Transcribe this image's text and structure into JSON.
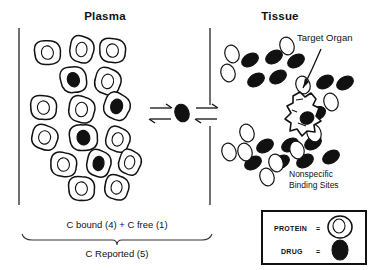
{
  "figure": {
    "type": "diagram",
    "background_color": "#ffffff",
    "ink_color": "#111111"
  },
  "headers": {
    "left": "Plasma",
    "right": "Tissue"
  },
  "annotations": {
    "target_organ": "Target Organ",
    "nonspecific_line1": "Nonspecific",
    "nonspecific_line2": "Binding Sites"
  },
  "bracket": {
    "top_text": "C bound (4) + C free (1)",
    "bottom_text": "C Reported (5)"
  },
  "legend": {
    "rows": [
      {
        "label": "PROTEIN",
        "equals": "=",
        "symbol": "protein-outline"
      },
      {
        "label": "DRUG",
        "equals": "=",
        "symbol": "drug-filled-ellipse"
      }
    ]
  },
  "counts": {
    "plasma_protein_cells": 16,
    "plasma_bound_drug": 4,
    "free_drug_center": 1,
    "c_bound": 4,
    "c_free": 1,
    "c_reported": 5
  },
  "plasma_cells": [
    {
      "cx": 48,
      "cy": 53,
      "rx": 13,
      "ry": 12,
      "bound": false,
      "rot": -12
    },
    {
      "cx": 82,
      "cy": 50,
      "rx": 12,
      "ry": 13,
      "bound": false,
      "rot": 6
    },
    {
      "cx": 113,
      "cy": 51,
      "rx": 13,
      "ry": 12,
      "bound": false,
      "rot": -6
    },
    {
      "cx": 74,
      "cy": 80,
      "rx": 13,
      "ry": 13,
      "bound": true,
      "rot": -18
    },
    {
      "cx": 108,
      "cy": 82,
      "rx": 13,
      "ry": 13,
      "bound": false,
      "rot": 10
    },
    {
      "cx": 44,
      "cy": 108,
      "rx": 13,
      "ry": 12,
      "bound": false,
      "rot": -8
    },
    {
      "cx": 82,
      "cy": 110,
      "rx": 13,
      "ry": 13,
      "bound": false,
      "rot": 4
    },
    {
      "cx": 117,
      "cy": 107,
      "rx": 13,
      "ry": 13,
      "bound": true,
      "rot": 16
    },
    {
      "cx": 45,
      "cy": 138,
      "rx": 13,
      "ry": 12,
      "bound": false,
      "rot": 8
    },
    {
      "cx": 84,
      "cy": 138,
      "rx": 14,
      "ry": 13,
      "bound": true,
      "rot": -14
    },
    {
      "cx": 118,
      "cy": 140,
      "rx": 12,
      "ry": 12,
      "bound": false,
      "rot": 12
    },
    {
      "cx": 64,
      "cy": 165,
      "rx": 13,
      "ry": 12,
      "bound": false,
      "rot": -4
    },
    {
      "cx": 99,
      "cy": 164,
      "rx": 12,
      "ry": 13,
      "bound": true,
      "rot": 8
    },
    {
      "cx": 82,
      "cy": 189,
      "rx": 13,
      "ry": 12,
      "bound": false,
      "rot": -10
    },
    {
      "cx": 117,
      "cy": 188,
      "rx": 12,
      "ry": 12,
      "bound": false,
      "rot": 6
    },
    {
      "cx": 130,
      "cy": 163,
      "rx": 11,
      "ry": 12,
      "bound": false,
      "rot": 14
    }
  ],
  "free_drug": {
    "cx": 182,
    "cy": 113,
    "rx": 7,
    "ry": 9,
    "rot": -20
  },
  "tissue_drugs": [
    {
      "cx": 250,
      "cy": 60,
      "rx": 9,
      "ry": 6,
      "rot": -30
    },
    {
      "cx": 274,
      "cy": 57,
      "rx": 9,
      "ry": 6,
      "rot": -30
    },
    {
      "cx": 296,
      "cy": 61,
      "rx": 9,
      "ry": 6,
      "rot": -30
    },
    {
      "cx": 256,
      "cy": 80,
      "rx": 9,
      "ry": 6,
      "rot": -30
    },
    {
      "cx": 278,
      "cy": 77,
      "rx": 9,
      "ry": 6,
      "rot": -30
    },
    {
      "cx": 325,
      "cy": 82,
      "rx": 9,
      "ry": 6,
      "rot": -30
    },
    {
      "cx": 345,
      "cy": 83,
      "rx": 9,
      "ry": 6,
      "rot": -30
    },
    {
      "cx": 318,
      "cy": 113,
      "rx": 8,
      "ry": 6,
      "rot": -30
    },
    {
      "cx": 265,
      "cy": 146,
      "rx": 9,
      "ry": 6,
      "rot": -30
    },
    {
      "cx": 290,
      "cy": 145,
      "rx": 9,
      "ry": 6,
      "rot": -30
    },
    {
      "cx": 313,
      "cy": 143,
      "rx": 9,
      "ry": 6,
      "rot": -30
    },
    {
      "cx": 253,
      "cy": 163,
      "rx": 9,
      "ry": 6,
      "rot": -30
    },
    {
      "cx": 281,
      "cy": 162,
      "rx": 9,
      "ry": 6,
      "rot": -30
    },
    {
      "cx": 305,
      "cy": 161,
      "rx": 9,
      "ry": 6,
      "rot": -30
    },
    {
      "cx": 331,
      "cy": 157,
      "rx": 9,
      "ry": 6,
      "rot": -30
    }
  ],
  "tissue_sites": [
    {
      "cx": 232,
      "cy": 54,
      "rx": 7,
      "ry": 9,
      "rot": -20
    },
    {
      "cx": 228,
      "cy": 73,
      "rx": 7,
      "ry": 9,
      "rot": -20
    },
    {
      "cx": 287,
      "cy": 46,
      "rx": 7,
      "ry": 9,
      "rot": -20
    },
    {
      "cx": 303,
      "cy": 85,
      "rx": 7,
      "ry": 9,
      "rot": -20
    },
    {
      "cx": 331,
      "cy": 102,
      "rx": 7,
      "ry": 9,
      "rot": -20
    },
    {
      "cx": 314,
      "cy": 133,
      "rx": 7,
      "ry": 9,
      "rot": -20
    },
    {
      "cx": 247,
      "cy": 133,
      "rx": 7,
      "ry": 9,
      "rot": -20
    },
    {
      "cx": 229,
      "cy": 152,
      "rx": 7,
      "ry": 9,
      "rot": -20
    },
    {
      "cx": 245,
      "cy": 152,
      "rx": 7,
      "ry": 9,
      "rot": -20
    },
    {
      "cx": 276,
      "cy": 163,
      "rx": 7,
      "ry": 9,
      "rot": -20
    },
    {
      "cx": 297,
      "cy": 150,
      "rx": 7,
      "ry": 9,
      "rot": -20
    },
    {
      "cx": 267,
      "cy": 177,
      "rx": 7,
      "ry": 9,
      "rot": -20
    }
  ],
  "target_organ_drug": {
    "cx": 307,
    "cy": 118,
    "rx": 7,
    "ry": 6,
    "rot": -20
  }
}
